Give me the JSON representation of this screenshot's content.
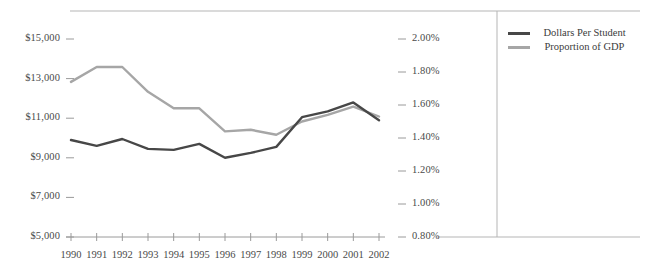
{
  "chart_data": {
    "type": "line",
    "title": "",
    "xlabel": "",
    "ylabel": "",
    "grid": false,
    "legend_position": "right",
    "categories": [
      "1990",
      "1991",
      "1992",
      "1993",
      "1994",
      "1995",
      "1996",
      "1997",
      "1998",
      "1999",
      "2000",
      "2001",
      "2002"
    ],
    "axes": {
      "left": {
        "label": "",
        "ylim": [
          5000,
          15000
        ],
        "tick_values": [
          5000,
          7000,
          9000,
          11000,
          13000,
          15000
        ],
        "tick_labels": [
          "$5,000",
          "$7,000",
          "$9,000",
          "$11,000",
          "$13,000",
          "$15,000"
        ]
      },
      "right": {
        "label": "",
        "ylim": [
          0.8,
          2.0
        ],
        "tick_values": [
          0.8,
          1.0,
          1.2,
          1.4,
          1.6,
          1.8,
          2.0
        ],
        "tick_labels": [
          "0.80%",
          "1.00%",
          "1.20%",
          "1.40%",
          "1.60%",
          "1.80%",
          "2.00%"
        ]
      }
    },
    "series": [
      {
        "name": "Dollars Per Student",
        "legend_label_line1": "Dollars Per",
        "legend_label_line2": "Student",
        "axis": "left",
        "color": "#474747",
        "values": [
          9900,
          9600,
          9950,
          9450,
          9400,
          9700,
          9000,
          9250,
          9550,
          11050,
          11350,
          11800,
          10900
        ]
      },
      {
        "name": "Proportion of GDP",
        "legend_label_line1": "Proportion of",
        "legend_label_line2": "GDP",
        "axis": "right",
        "color": "#a6a6a6",
        "values": [
          1.74,
          1.83,
          1.83,
          1.68,
          1.58,
          1.58,
          1.44,
          1.45,
          1.42,
          1.5,
          1.54,
          1.59,
          1.53
        ]
      }
    ]
  },
  "colors": {
    "series_dark": "#474747",
    "series_light": "#a6a6a6",
    "axis_line": "#9a9a9a",
    "frame_line": "#b5b5b5",
    "divider_line": "#b5b5b5",
    "text": "#4a4a4a"
  }
}
